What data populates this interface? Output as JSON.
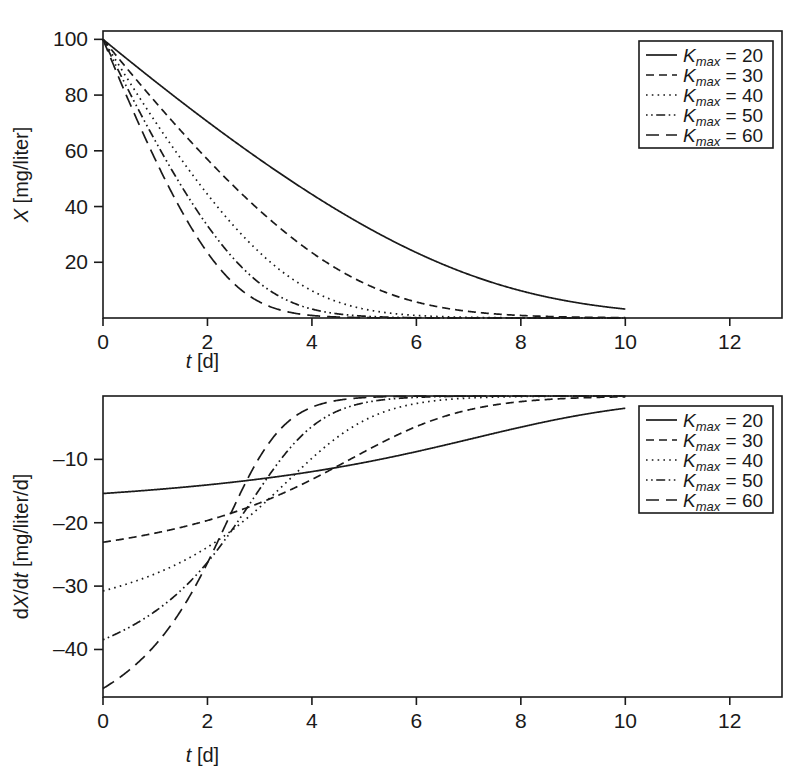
{
  "figure": {
    "panels": [
      "top",
      "bottom"
    ],
    "background": "#ffffff",
    "ink": "#1a1a1a"
  },
  "chart_data": [
    {
      "type": "line",
      "panel": "top",
      "title": "",
      "xlabel": "t [d]",
      "ylabel": "X [mg/liter]",
      "xlim": [
        0,
        13
      ],
      "ylim": [
        0,
        103
      ],
      "xticks": [
        0,
        2,
        4,
        6,
        8,
        10,
        12
      ],
      "xticklabels": [
        "0",
        "2",
        "4",
        "6",
        "8",
        "10",
        "12"
      ],
      "yticks": [
        20,
        40,
        60,
        80,
        100
      ],
      "yticklabels": [
        "20",
        "40",
        "60",
        "80",
        "100"
      ],
      "grid": false,
      "legend_position": "upper right",
      "model": "Monod / Michaelis-Menten depletion: dX/dt = -Kmax*X/(Km + X), X(0) = 100, Km = 30",
      "x_start": 0,
      "x_end": 10,
      "initial_value": 100,
      "km": 30,
      "series": [
        {
          "name": "Kmax = 20",
          "kmax": 20,
          "dash": "solid",
          "x": [
            0,
            1,
            2,
            3,
            4,
            5,
            6,
            7,
            8,
            9,
            10
          ],
          "values": [
            100,
            87.1,
            74.1,
            61.0,
            47.9,
            34.9,
            22.4,
            11.6,
            4.3,
            1.1,
            0.2
          ]
        },
        {
          "name": "Kmax = 30",
          "kmax": 30,
          "dash": "dashed",
          "x": [
            0,
            1,
            2,
            3,
            4,
            5,
            6,
            7,
            8,
            9,
            10
          ],
          "values": [
            100,
            80.6,
            61.1,
            41.6,
            22.8,
            8.3,
            1.5,
            0.2,
            0.0,
            0.0,
            0.0
          ]
        },
        {
          "name": "Kmax = 40",
          "kmax": 40,
          "dash": "dotted",
          "x": [
            0,
            1,
            2,
            3,
            4,
            5,
            6,
            7,
            8,
            9,
            10
          ],
          "values": [
            100,
            74.1,
            48.0,
            22.5,
            4.8,
            0.3,
            0.0,
            0.0,
            0.0,
            0.0,
            0.0
          ]
        },
        {
          "name": "Kmax = 50",
          "kmax": 50,
          "dash": "dashdot",
          "x": [
            0,
            1,
            2,
            3,
            4,
            5,
            6,
            7,
            8,
            9,
            10
          ],
          "values": [
            100,
            67.6,
            35.0,
            8.2,
            0.3,
            0.0,
            0.0,
            0.0,
            0.0,
            0.0,
            0.0
          ]
        },
        {
          "name": "Kmax = 60",
          "kmax": 60,
          "dash": "longdash",
          "x": [
            0,
            1,
            2,
            3,
            4,
            5,
            6,
            7,
            8,
            9,
            10
          ],
          "values": [
            100,
            61.2,
            22.8,
            1.5,
            0.0,
            0.0,
            0.0,
            0.0,
            0.0,
            0.0,
            0.0
          ]
        }
      ],
      "legend": {
        "entries": [
          {
            "symbol": "K",
            "sub": "max",
            "eq": "= 20",
            "dash": "solid"
          },
          {
            "symbol": "K",
            "sub": "max",
            "eq": "= 30",
            "dash": "dashed"
          },
          {
            "symbol": "K",
            "sub": "max",
            "eq": "= 40",
            "dash": "dotted"
          },
          {
            "symbol": "K",
            "sub": "max",
            "eq": "= 50",
            "dash": "dashdot"
          },
          {
            "symbol": "K",
            "sub": "max",
            "eq": "= 60",
            "dash": "longdash"
          }
        ]
      }
    },
    {
      "type": "line",
      "panel": "bottom",
      "title": "",
      "xlabel": "t [d]",
      "ylabel": "dX/dt [mg/liter/d]",
      "xlim": [
        0,
        13
      ],
      "ylim": [
        -47.5,
        0
      ],
      "xticks": [
        0,
        2,
        4,
        6,
        8,
        10,
        12
      ],
      "xticklabels": [
        "0",
        "2",
        "4",
        "6",
        "8",
        "10",
        "12"
      ],
      "yticks": [
        -10,
        -20,
        -30,
        -40
      ],
      "yticklabels": [
        "–10",
        "–20",
        "–30",
        "–40"
      ],
      "grid": false,
      "legend_position": "upper right",
      "model": "Derivative of Monod depletion: dX/dt = -Kmax*X/(Km + X), Km = 30",
      "x_start": 0,
      "x_end": 10,
      "km": 30,
      "series": [
        {
          "name": "Kmax = 20",
          "kmax": 20,
          "dash": "solid",
          "x": [
            0,
            1,
            2,
            3,
            4,
            5,
            6,
            7,
            8,
            9,
            10
          ],
          "values": [
            -15.4,
            -14.9,
            -14.2,
            -13.4,
            -12.3,
            -11.1,
            -8.5,
            -5.6,
            -2.5,
            -0.7,
            -0.1
          ]
        },
        {
          "name": "Kmax = 30",
          "kmax": 30,
          "dash": "dashed",
          "x": [
            0,
            1,
            2,
            3,
            4,
            5,
            6,
            7,
            8,
            9,
            10
          ],
          "values": [
            -23.1,
            -21.8,
            -20.4,
            -17.5,
            -12.9,
            -6.5,
            -1.4,
            -0.2,
            0.0,
            0.0,
            0.0
          ]
        },
        {
          "name": "Kmax = 40",
          "kmax": 40,
          "dash": "dotted",
          "x": [
            0,
            1,
            2,
            3,
            4,
            5,
            6,
            7,
            8,
            9,
            10
          ],
          "values": [
            -30.8,
            -28.5,
            -24.6,
            -17.2,
            -5.5,
            -0.4,
            0.0,
            0.0,
            0.0,
            0.0,
            0.0
          ]
        },
        {
          "name": "Kmax = 50",
          "kmax": 50,
          "dash": "dashdot",
          "x": [
            0,
            1,
            2,
            3,
            4,
            5,
            6,
            7,
            8,
            9,
            10
          ],
          "values": [
            -38.5,
            -34.5,
            -26.9,
            -10.7,
            -0.5,
            0.0,
            0.0,
            0.0,
            0.0,
            0.0,
            0.0
          ]
        },
        {
          "name": "Kmax = 60",
          "kmax": 60,
          "dash": "longdash",
          "x": [
            0,
            1,
            2,
            3,
            4,
            5,
            6,
            7,
            8,
            9,
            10
          ],
          "values": [
            -46.2,
            -40.3,
            -25.9,
            -2.9,
            -0.0,
            0.0,
            0.0,
            0.0,
            0.0,
            0.0,
            0.0
          ]
        }
      ],
      "legend": {
        "entries": [
          {
            "symbol": "K",
            "sub": "max",
            "eq": "= 20",
            "dash": "solid"
          },
          {
            "symbol": "K",
            "sub": "max",
            "eq": "= 30",
            "dash": "dashed"
          },
          {
            "symbol": "K",
            "sub": "max",
            "eq": "= 40",
            "dash": "dotted"
          },
          {
            "symbol": "K",
            "sub": "max",
            "eq": "= 50",
            "dash": "dashdot"
          },
          {
            "symbol": "K",
            "sub": "max",
            "eq": "= 60",
            "dash": "longdash"
          }
        ]
      }
    }
  ]
}
